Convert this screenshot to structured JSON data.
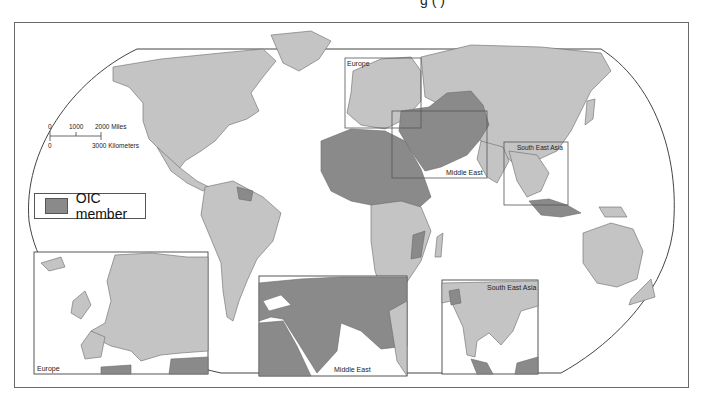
{
  "figure": {
    "top_caption_fragment": "g                                                (  )",
    "colors": {
      "oic_member": "#8a8a8a",
      "non_member": "#c4c4c4",
      "border": "#6a6a6a",
      "ocean": "#ffffff"
    }
  },
  "scale_bar": {
    "miles_ticks": [
      "0",
      "1000",
      "2000 Miles"
    ],
    "km_ticks": [
      "0",
      "3000 Kilometers"
    ]
  },
  "legend": {
    "items": [
      {
        "label": "OIC member",
        "color": "#8a8a8a"
      }
    ]
  },
  "main_map": {
    "inset_frames": [
      {
        "label": "Europe"
      },
      {
        "label": "Middle East"
      },
      {
        "label": "South East Asia"
      }
    ]
  },
  "insets": [
    {
      "label": "Europe"
    },
    {
      "label": "Middle East"
    },
    {
      "label": "South East Asia"
    }
  ]
}
